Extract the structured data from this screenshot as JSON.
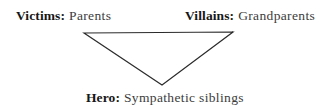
{
  "diagram": {
    "background_color": "#ffffff",
    "stroke_color": "#2b2b2b",
    "bold_text_color": "#171717",
    "regular_text_color": "#3c3c3c",
    "labels": [
      {
        "id": "victims",
        "role": "Victims:",
        "value": "Parents",
        "position": "top-left"
      },
      {
        "id": "villains",
        "role": "Villains:",
        "value": "Grandparents",
        "position": "top-right"
      },
      {
        "id": "hero",
        "role": "Hero:",
        "value": "Sympathetic siblings",
        "position": "bottom-center"
      }
    ],
    "shape": {
      "type": "triangle",
      "orientation": "inverted",
      "points": "84,33 233,32 162,85"
    }
  }
}
